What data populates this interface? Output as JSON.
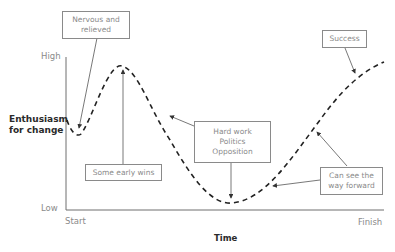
{
  "diagram": {
    "type": "change-curve",
    "y_axis": {
      "label_line1": "Enthusiasm",
      "label_line2": "for change",
      "high": "High",
      "low": "Low"
    },
    "x_axis": {
      "label": "Time",
      "start": "Start",
      "finish": "Finish"
    },
    "callouts": [
      {
        "id": "nervous",
        "lines": [
          "Nervous and",
          "relieved"
        ]
      },
      {
        "id": "early-wins",
        "lines": [
          "Some early wins"
        ]
      },
      {
        "id": "hard-work",
        "lines": [
          "Hard work",
          "Politics",
          "Opposition"
        ]
      },
      {
        "id": "way-forward",
        "lines": [
          "Can see the",
          "way forward"
        ]
      },
      {
        "id": "success",
        "lines": [
          "Success"
        ]
      }
    ],
    "colors": {
      "curve": "#222222",
      "axis": "#6e6e6e",
      "callout_border": "#8a8a8a",
      "callout_text": "#8a8a8a"
    }
  }
}
